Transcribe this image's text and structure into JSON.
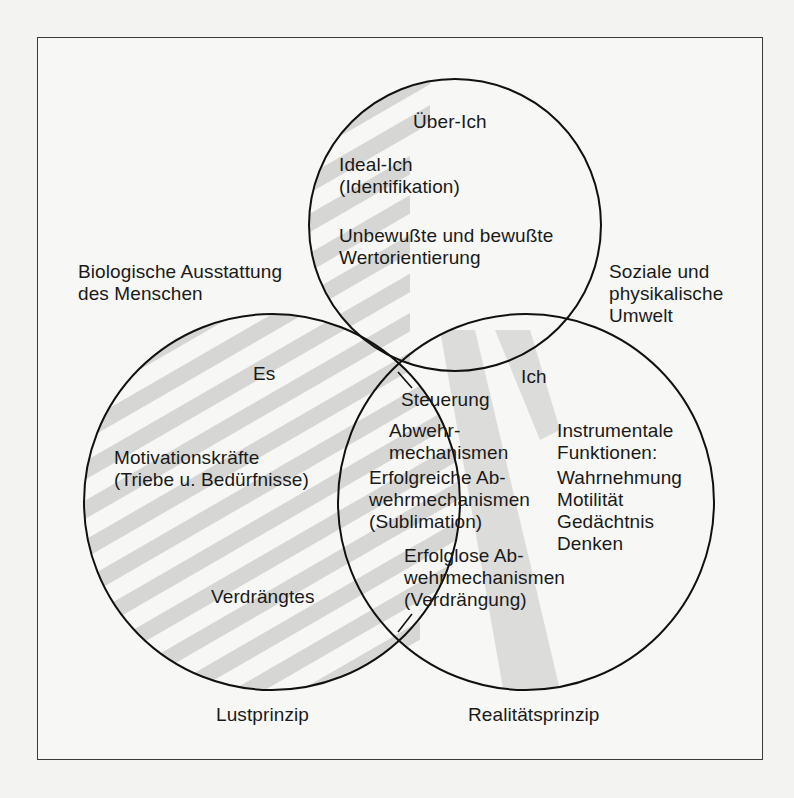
{
  "diagram": {
    "type": "venn-three-circle",
    "circles": [
      {
        "id": "ueber-ich",
        "cx": 455,
        "cy": 225,
        "r": 146,
        "title": "Über-Ich"
      },
      {
        "id": "es",
        "cx": 272,
        "cy": 502,
        "r": 188,
        "title": "Es"
      },
      {
        "id": "ich",
        "cx": 526,
        "cy": 502,
        "r": 188,
        "title": "Ich"
      }
    ],
    "colors": {
      "stroke": "#111111",
      "stripe": "#d4d4d2",
      "background": "#f7f7f5",
      "text": "#1a1a1a"
    }
  },
  "labels": {
    "ueber_ich": "Über-Ich",
    "ideal_ich": "Ideal-Ich\n(Identifikation)",
    "wertorientierung": "Unbewußte und bewußte\nWertorientierung",
    "biologische": "Biologische Ausstattung\ndes Menschen",
    "soziale": "Soziale und\nphysikalische\nUmwelt",
    "es": "Es",
    "ich": "Ich",
    "steuerung": "Steuerung",
    "abwehr": "Abwehr-\nmechanismen",
    "motivation": "Motivationskräfte\n(Triebe u. Bedürfnisse)",
    "erfolgreiche": "Erfolgreiche Ab-\nwehrmechanismen\n(Sublimation)",
    "instrumentale": "Instrumentale\nFunktionen:",
    "funktionen_list": "Wahrnehmung\nMotilität\nGedächtnis\nDenken",
    "erfolglose": "Erfolglose Ab-\nwehrmechanismen\n(Verdrängung)",
    "verdraengtes": "Verdrängtes",
    "lustprinzip": "Lustprinzip",
    "realitaetsprinzip": "Realitätsprinzip"
  }
}
